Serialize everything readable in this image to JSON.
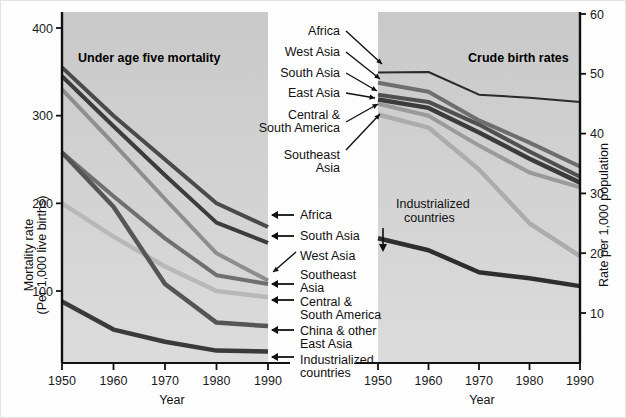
{
  "figure": {
    "background": "#fdfdfd",
    "plot_background": "#c9c9c9",
    "axis_color": "#1a1a1a"
  },
  "chart_data": {
    "type": "line",
    "title": "",
    "panels": [
      {
        "id": "left",
        "title": "Under age five mortality",
        "xlabel": "Year",
        "ylabel_line1": "Mortality rate",
        "ylabel_line2": "(Per 1,000 live births)",
        "x": [
          1950,
          1960,
          1970,
          1980,
          1990
        ],
        "xlim": [
          1950,
          1990
        ],
        "ylim": [
          0,
          420
        ],
        "yticks": [
          100,
          200,
          300,
          400
        ],
        "xticks": [
          1950,
          1960,
          1970,
          1980,
          1990
        ],
        "grid": false,
        "series": [
          {
            "name": "Africa",
            "color": "#4a4a4a",
            "width": 4.0,
            "values": [
              355,
              300,
              250,
              200,
              173
            ]
          },
          {
            "name": "South Asia",
            "color": "#3c3c3c",
            "width": 4.0,
            "values": [
              345,
              288,
              232,
              178,
              155
            ]
          },
          {
            "name": "West Asia",
            "color": "#8e8e8e",
            "width": 4.0,
            "values": [
              330,
              268,
              205,
              143,
              112
            ]
          },
          {
            "name": "Southeast Asia",
            "color": "#6f6f6f",
            "width": 4.0,
            "values": [
              258,
              208,
              160,
              118,
              108
            ]
          },
          {
            "name": "Central & South America",
            "color": "#b8b8b8",
            "width": 4.5,
            "values": [
              200,
              162,
              128,
              100,
              93
            ]
          },
          {
            "name": "China & other East Asia",
            "color": "#555555",
            "width": 4.5,
            "values": [
              258,
              196,
              108,
              64,
              60
            ]
          },
          {
            "name": "Industrialized countries",
            "color": "#3a3a3a",
            "width": 4.5,
            "values": [
              88,
              56,
              42,
              32,
              31
            ]
          }
        ]
      },
      {
        "id": "right",
        "title": "Crude birth rates",
        "xlabel": "Year",
        "ylabel": "Rate per 1,000 population",
        "x": [
          1950,
          1960,
          1970,
          1980,
          1990
        ],
        "xlim": [
          1950,
          1990
        ],
        "ylim": [
          0,
          62
        ],
        "yticks": [
          10,
          20,
          30,
          40,
          50,
          60
        ],
        "xticks": [
          1950,
          1960,
          1970,
          1980,
          1990
        ],
        "grid": false,
        "series": [
          {
            "name": "Africa",
            "color": "#2a2a2a",
            "width": 2.0,
            "values": [
              50.2,
              50.3,
              46.5,
              46.0,
              45.3
            ]
          },
          {
            "name": "West Asia",
            "color": "#6e6e6e",
            "width": 4.0,
            "values": [
              48.5,
              47.0,
              42.2,
              38.5,
              34.5
            ]
          },
          {
            "name": "South Asia",
            "color": "#505050",
            "width": 4.0,
            "values": [
              46.5,
              45.3,
              41.5,
              37.0,
              32.8
            ]
          },
          {
            "name": "East Asia",
            "color": "#3b3b3b",
            "width": 4.5,
            "values": [
              45.7,
              44.3,
              40.2,
              35.8,
              31.8
            ]
          },
          {
            "name": "Central & South America",
            "color": "#9a9a9a",
            "width": 4.0,
            "values": [
              45.0,
              43.0,
              38.0,
              33.5,
              31.0
            ]
          },
          {
            "name": "Southeast Asia",
            "color": "#acacac",
            "width": 4.5,
            "values": [
              43.2,
              41.0,
              34.0,
              25.0,
              19.5
            ]
          },
          {
            "name": "Industrialized countries",
            "color": "#2e2e2e",
            "width": 4.5,
            "values": [
              22.5,
              20.5,
              16.8,
              15.8,
              14.5
            ]
          }
        ]
      }
    ]
  },
  "left_panel_annotations": [
    {
      "key": "africa",
      "label": "Africa",
      "sublabel": ""
    },
    {
      "key": "south-asia",
      "label": "South Asia",
      "sublabel": ""
    },
    {
      "key": "west-asia",
      "label": "West Asia",
      "sublabel": ""
    },
    {
      "key": "southeast-asia",
      "label": "Southeast",
      "sublabel": "Asia"
    },
    {
      "key": "central-south-america",
      "label": "Central &",
      "sublabel": "South America"
    },
    {
      "key": "china-east-asia",
      "label": "China & other",
      "sublabel": "East Asia"
    },
    {
      "key": "industrialized",
      "label": "Industrialized",
      "sublabel": "countries"
    }
  ],
  "right_panel_annotations": [
    {
      "key": "africa",
      "label": "Africa",
      "sublabel": ""
    },
    {
      "key": "west-asia",
      "label": "West Asia",
      "sublabel": ""
    },
    {
      "key": "south-asia",
      "label": "South Asia",
      "sublabel": ""
    },
    {
      "key": "east-asia",
      "label": "East Asia",
      "sublabel": ""
    },
    {
      "key": "central-south-america",
      "label": "Central &",
      "sublabel": "South America"
    },
    {
      "key": "southeast-asia",
      "label": "Southeast",
      "sublabel": "Asia"
    },
    {
      "key": "industrialized",
      "label": "Industrialized",
      "sublabel": "countries"
    }
  ],
  "axis_text": {
    "left_y_l1": "Mortality rate",
    "left_y_l2": "(Per 1,000 live births)",
    "right_y": "Rate per 1,000 population",
    "x_left": "Year",
    "x_right": "Year",
    "left_yticks": [
      "400",
      "300",
      "200",
      "100"
    ],
    "right_yticks": [
      "60",
      "50",
      "40",
      "30",
      "20",
      "10"
    ],
    "left_xticks": [
      "1950",
      "1960",
      "1970",
      "1980",
      "1990"
    ],
    "right_xticks": [
      "1950",
      "1960",
      "1970",
      "1980",
      "1990"
    ]
  },
  "titles": {
    "left": "Under age five mortality",
    "right": "Crude birth rates"
  }
}
